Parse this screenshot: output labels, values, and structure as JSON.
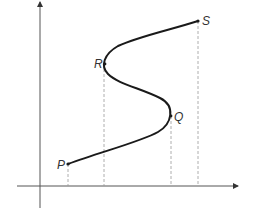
{
  "diagram": {
    "type": "s-curve-graph",
    "colors": {
      "background": "#ffffff",
      "curve": "#1a1a1a",
      "axes": "#444444",
      "dashed": "#999999",
      "label": "#333333"
    },
    "axes": {
      "x_axis": {
        "label": ""
      },
      "y_axis": {
        "label": ""
      }
    },
    "points": [
      {
        "id": "P",
        "label": "P"
      },
      {
        "id": "Q",
        "label": "Q"
      },
      {
        "id": "R",
        "label": "R"
      },
      {
        "id": "S",
        "label": "S"
      }
    ]
  }
}
